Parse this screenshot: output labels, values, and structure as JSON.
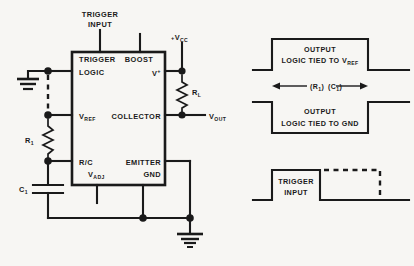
{
  "diagram": {
    "ic": {
      "pins": {
        "trigger": "TRIGGER",
        "logic": "LOGIC",
        "boost": "BOOST",
        "vplus": "V",
        "vplus_sup": "+",
        "vref": "V",
        "vref_sub": "REF",
        "collector": "COLLECTOR",
        "rc": "R/C",
        "vadj": "V",
        "vadj_sub": "ADJ",
        "emitter": "EMITTER",
        "gnd": "GND"
      }
    },
    "external_labels": {
      "trigger_input_line1": "TRIGGER",
      "trigger_input_line2": "INPUT",
      "vcc": "V",
      "vcc_sub": "CC",
      "vcc_sign": "+",
      "rl": "R",
      "rl_sub": "L",
      "vout": "V",
      "vout_sub": "OUT",
      "r1": "R",
      "r1_sub": "1",
      "c1": "C",
      "c1_sub": "1"
    },
    "waveforms": [
      {
        "id": "output-vref",
        "label_line1": "OUTPUT",
        "label_line2_pre": "LOGIC TIED TO V",
        "label_line2_sub": "REF"
      },
      {
        "id": "output-gnd",
        "label_line1": "OUTPUT",
        "label_line2": "LOGIC TIED TO GND"
      },
      {
        "id": "trigger-input",
        "label_line1": "TRIGGER",
        "label_line2": "INPUT"
      }
    ],
    "timing_annotation": {
      "r_open": "(R",
      "r_sub": "1",
      "r_close": ")",
      "c_open": "(C",
      "c_sub": "1",
      "c_close": ")"
    },
    "colors": {
      "ink": "#1a1a1a",
      "paper": "#f7f6f3"
    }
  }
}
